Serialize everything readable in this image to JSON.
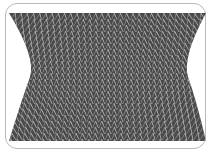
{
  "figure": {
    "colors": {
      "frame_border": "#b9b9b9",
      "background": "#ffffff",
      "stitch_dark": "#4a4a4a",
      "stitch_mid": "#8a8a8a",
      "stitch_light": "#bdbdbd"
    },
    "fabric": {
      "top_y": 13,
      "bottom_y": 141,
      "top_left_x": 9,
      "top_right_x": 206,
      "waist_left_x": 30,
      "waist_right_x": 188,
      "waist_y": 77,
      "stitch_columns": 32,
      "stitch_rows": 22
    }
  }
}
